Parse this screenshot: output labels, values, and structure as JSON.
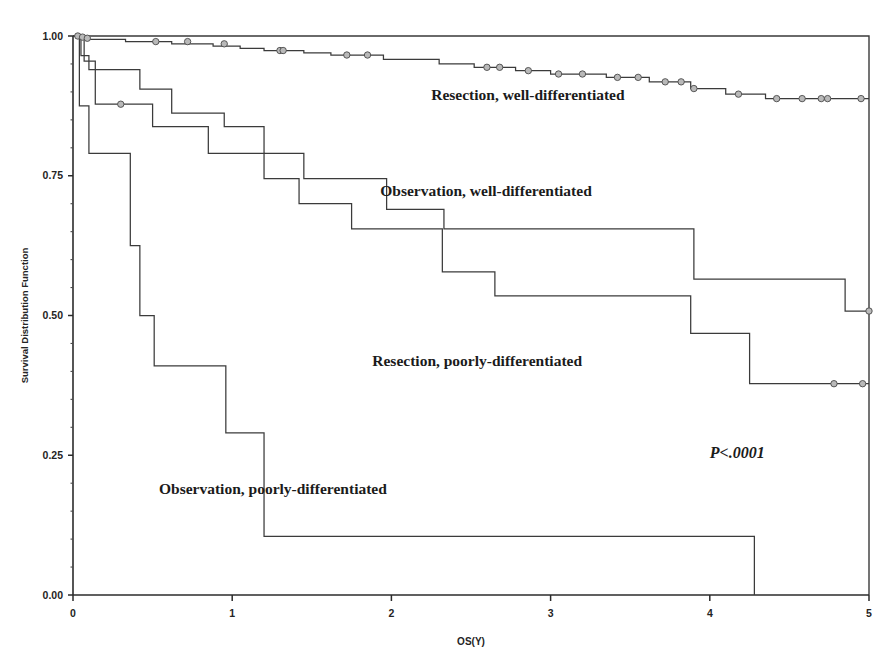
{
  "chart_data": {
    "type": "line",
    "subtype": "kaplan-meier-step",
    "title": "",
    "xlabel": "OS(Y)",
    "ylabel": "Survival Distribution Function",
    "xlim": [
      0,
      5
    ],
    "ylim": [
      0,
      1
    ],
    "xticks": [
      "0",
      "1",
      "2",
      "3",
      "4",
      "5"
    ],
    "xtick_values": [
      0,
      1,
      2,
      3,
      4,
      5
    ],
    "yticks": [
      "0.00",
      "0.25",
      "0.50",
      "0.75",
      "1.00"
    ],
    "ytick_values": [
      0,
      0.25,
      0.5,
      0.75,
      1
    ],
    "grid": false,
    "legend_position": "inline-annotations",
    "pvalue": "P<.0001",
    "series": [
      {
        "name": "Resection, well-differentiated",
        "label": "Resection, well-differentiated",
        "label_x": 2.25,
        "label_y": 0.885,
        "color": "#3b3b3b",
        "steps": [
          [
            0.0,
            1.0
          ],
          [
            0.04,
            0.998
          ],
          [
            0.07,
            0.996
          ],
          [
            0.1,
            0.994
          ],
          [
            0.33,
            0.99
          ],
          [
            0.62,
            0.986
          ],
          [
            0.88,
            0.982
          ],
          [
            1.05,
            0.978
          ],
          [
            1.2,
            0.974
          ],
          [
            1.45,
            0.97
          ],
          [
            1.62,
            0.966
          ],
          [
            1.95,
            0.958
          ],
          [
            2.3,
            0.95
          ],
          [
            2.52,
            0.944
          ],
          [
            2.78,
            0.938
          ],
          [
            3.0,
            0.932
          ],
          [
            3.35,
            0.926
          ],
          [
            3.62,
            0.918
          ],
          [
            3.88,
            0.906
          ],
          [
            4.1,
            0.896
          ],
          [
            4.35,
            0.888
          ],
          [
            5.0,
            0.888
          ]
        ],
        "censors": [
          [
            0.03,
            1.0
          ],
          [
            0.06,
            0.998
          ],
          [
            0.09,
            0.996
          ],
          [
            0.52,
            0.99
          ],
          [
            0.72,
            0.99
          ],
          [
            0.95,
            0.986
          ],
          [
            1.3,
            0.974
          ],
          [
            1.32,
            0.974
          ],
          [
            1.72,
            0.966
          ],
          [
            1.85,
            0.966
          ],
          [
            2.6,
            0.944
          ],
          [
            2.68,
            0.944
          ],
          [
            2.86,
            0.938
          ],
          [
            3.05,
            0.932
          ],
          [
            3.2,
            0.932
          ],
          [
            3.42,
            0.926
          ],
          [
            3.55,
            0.926
          ],
          [
            3.72,
            0.918
          ],
          [
            3.82,
            0.918
          ],
          [
            3.9,
            0.906
          ],
          [
            4.18,
            0.896
          ],
          [
            4.42,
            0.888
          ],
          [
            4.58,
            0.888
          ],
          [
            4.7,
            0.888
          ],
          [
            4.74,
            0.888
          ],
          [
            4.95,
            0.888
          ]
        ]
      },
      {
        "name": "Observation, well-differentiated",
        "label": "Observation, well-differentiated",
        "label_x": 1.93,
        "label_y": 0.713,
        "color": "#3b3b3b",
        "steps": [
          [
            0.0,
            1.0
          ],
          [
            0.05,
            0.965
          ],
          [
            0.1,
            0.94
          ],
          [
            0.42,
            0.905
          ],
          [
            0.62,
            0.862
          ],
          [
            0.95,
            0.838
          ],
          [
            1.18,
            0.838
          ],
          [
            1.2,
            0.79
          ],
          [
            1.42,
            0.79
          ],
          [
            1.45,
            0.745
          ],
          [
            1.95,
            0.745
          ],
          [
            1.97,
            0.69
          ],
          [
            2.3,
            0.69
          ],
          [
            2.33,
            0.655
          ],
          [
            3.88,
            0.655
          ],
          [
            3.9,
            0.565
          ],
          [
            4.82,
            0.565
          ],
          [
            4.85,
            0.508
          ],
          [
            5.0,
            0.508
          ]
        ],
        "censors": [
          [
            5.0,
            0.508
          ]
        ]
      },
      {
        "name": "Resection, poorly-differentiated",
        "label": "Resection, poorly-differentiated",
        "label_x": 1.88,
        "label_y": 0.41,
        "color": "#3b3b3b",
        "steps": [
          [
            0.0,
            1.0
          ],
          [
            0.07,
            0.955
          ],
          [
            0.14,
            0.878
          ],
          [
            0.48,
            0.878
          ],
          [
            0.5,
            0.838
          ],
          [
            0.82,
            0.838
          ],
          [
            0.85,
            0.79
          ],
          [
            1.18,
            0.79
          ],
          [
            1.2,
            0.745
          ],
          [
            1.4,
            0.745
          ],
          [
            1.42,
            0.7
          ],
          [
            1.72,
            0.7
          ],
          [
            1.75,
            0.655
          ],
          [
            2.28,
            0.655
          ],
          [
            2.32,
            0.578
          ],
          [
            2.62,
            0.578
          ],
          [
            2.65,
            0.535
          ],
          [
            3.85,
            0.535
          ],
          [
            3.88,
            0.468
          ],
          [
            4.22,
            0.468
          ],
          [
            4.25,
            0.378
          ],
          [
            5.0,
            0.378
          ]
        ],
        "censors": [
          [
            0.3,
            0.878
          ],
          [
            4.78,
            0.378
          ],
          [
            4.96,
            0.378
          ]
        ]
      },
      {
        "name": "Observation, poorly-differentiated",
        "label": "Observation, poorly-differentiated",
        "label_x": 0.54,
        "label_y": 0.18,
        "color": "#3b3b3b",
        "steps": [
          [
            0.0,
            1.0
          ],
          [
            0.04,
            0.875
          ],
          [
            0.1,
            0.79
          ],
          [
            0.33,
            0.79
          ],
          [
            0.36,
            0.625
          ],
          [
            0.42,
            0.5
          ],
          [
            0.48,
            0.5
          ],
          [
            0.51,
            0.41
          ],
          [
            0.93,
            0.41
          ],
          [
            0.96,
            0.29
          ],
          [
            1.17,
            0.29
          ],
          [
            1.2,
            0.105
          ],
          [
            4.25,
            0.105
          ],
          [
            4.28,
            0.0
          ]
        ],
        "censors": []
      }
    ]
  },
  "plot_geometry": {
    "left": 73,
    "right": 869,
    "top": 36,
    "bottom": 595
  }
}
